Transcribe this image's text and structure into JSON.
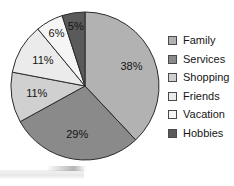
{
  "chart_data": {
    "type": "pie",
    "title": "",
    "subtitle": "",
    "xlabel": "",
    "ylabel": "",
    "grid": false,
    "legend_position": "right",
    "start_angle_deg": 0,
    "direction": "clockwise",
    "categories": [
      "Family",
      "Services",
      "Shopping",
      "Friends",
      "Vacation",
      "Hobbies"
    ],
    "values": [
      38,
      29,
      11,
      11,
      6,
      5
    ],
    "value_unit": "%",
    "data_labels": [
      "38%",
      "29%",
      "11%",
      "11%",
      "6%",
      "5%"
    ],
    "slice_colors": [
      "#b2b2b2",
      "#8a8a8a",
      "#d0d0d0",
      "#ebebeb",
      "#f5f5f5",
      "#5a5a5a"
    ],
    "slices": [
      {
        "label": "Family",
        "value": 38,
        "display": "38%",
        "color": "#b2b2b2"
      },
      {
        "label": "Services",
        "value": 29,
        "display": "29%",
        "color": "#8a8a8a"
      },
      {
        "label": "Shopping",
        "value": 11,
        "display": "11%",
        "color": "#d0d0d0"
      },
      {
        "label": "Friends",
        "value": 11,
        "display": "11%",
        "color": "#ebebeb"
      },
      {
        "label": "Vacation",
        "value": 6,
        "display": "6%",
        "color": "#f5f5f5"
      },
      {
        "label": "Hobbies",
        "value": 5,
        "display": "5%",
        "color": "#5a5a5a"
      }
    ]
  },
  "legend": {
    "items": [
      {
        "label": "Family",
        "color": "#b2b2b2"
      },
      {
        "label": "Services",
        "color": "#8a8a8a"
      },
      {
        "label": "Shopping",
        "color": "#d0d0d0"
      },
      {
        "label": "Friends",
        "color": "#ebebeb"
      },
      {
        "label": "Vacation",
        "color": "#f5f5f5"
      },
      {
        "label": "Hobbies",
        "color": "#5a5a5a"
      }
    ]
  },
  "geometry": {
    "center_x": 85,
    "center_y": 86,
    "radius": 74,
    "label_radius": 50
  },
  "colors": {
    "outline": "#2b2b2b",
    "label_text": "#141414",
    "background": "#ffffff"
  }
}
